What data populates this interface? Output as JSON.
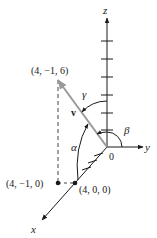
{
  "diagram": {
    "axes": {
      "x_label": "x",
      "y_label": "y",
      "z_label": "z",
      "origin_label": "0"
    },
    "vector": {
      "label": "v",
      "color": "#9a9a9a"
    },
    "points": [
      {
        "label": "(4, −1, 6)"
      },
      {
        "label": "(4, −1, 0)"
      },
      {
        "label": "(4, 0, 0)"
      }
    ],
    "angles": {
      "alpha": "α",
      "beta": "β",
      "gamma": "γ"
    },
    "colors": {
      "ink": "#1a1a1a",
      "vector": "#9a9a9a",
      "dashed": "#444444"
    }
  }
}
